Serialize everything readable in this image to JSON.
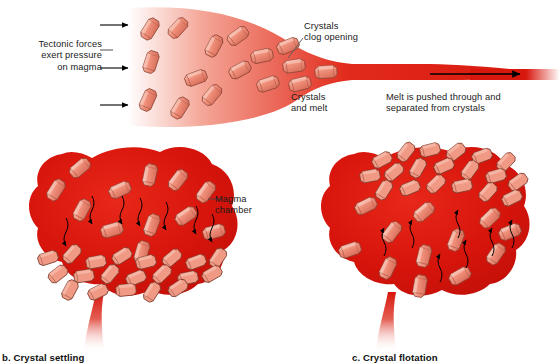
{
  "figure": {
    "type": "diagram",
    "panels": [
      {
        "id": "filter-pressing",
        "caption": "",
        "position": "top"
      },
      {
        "id": "crystal-settling",
        "caption": "b. Crystal settling",
        "position": "bottom-left"
      },
      {
        "id": "crystal-flotation",
        "caption": "c. Crystal flotation",
        "position": "bottom-right"
      }
    ]
  },
  "labels": {
    "tectonic": "Tectonic forces\nexert pressure\non magma",
    "clog": "Crystals\nclog opening",
    "crystals_and_melt": "Crystals\nand melt",
    "melt_pushed": "Melt is pushed through and\nseparated from crystals",
    "magma_chamber": "Magma\nchamber"
  },
  "captions": {
    "settling": "b. Crystal settling",
    "flotation": "c. Crystal flotation"
  },
  "colors": {
    "magma_red": "#e01b10",
    "magma_deep": "#c7120b",
    "magma_fade": "#f6b9ae",
    "crystal_fill": "#f08a78",
    "crystal_light": "#f7b3a3",
    "crystal_shade": "#d9705c",
    "crystal_outline": "#7a3a2c",
    "text": "#1b1b1b",
    "arrow": "#000000",
    "background": "#ffffff"
  },
  "arrows": {
    "tectonic_count": 3,
    "tectonic_direction": "right",
    "melt_direction": "right",
    "settling_direction": "down",
    "settling_count": 7,
    "flotation_direction": "up",
    "flotation_count": 7
  }
}
